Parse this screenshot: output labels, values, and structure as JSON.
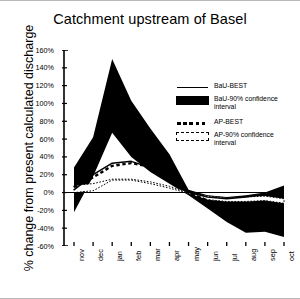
{
  "chart_data": {
    "type": "area",
    "title": "Catchment upstream of Basel",
    "xlabel": "",
    "ylabel": "% change from present calculated discharge",
    "categories": [
      "nov",
      "dec",
      "jan",
      "feb",
      "mar",
      "apr",
      "may",
      "jun",
      "jul",
      "aug",
      "sep",
      "oct"
    ],
    "ylim": [
      -60,
      160
    ],
    "ytick_labels": [
      "160%",
      "140%",
      "120%",
      "100%",
      "80%",
      "60%",
      "40%",
      "20%",
      "0%",
      "-20%",
      "-40%",
      "-60%"
    ],
    "ytick_values": [
      160,
      140,
      120,
      100,
      80,
      60,
      40,
      20,
      0,
      -20,
      -40,
      -60
    ],
    "grid": false,
    "legend_position": "upper right",
    "series": [
      {
        "name": "BaU-BEST",
        "style": "solid-line",
        "values": [
          3,
          20,
          33,
          35,
          28,
          14,
          0,
          -5,
          -7,
          -5,
          -2,
          1
        ]
      },
      {
        "name": "BaU-90% confidence interval",
        "style": "filled-band",
        "upper": [
          28,
          62,
          150,
          103,
          72,
          43,
          3,
          -3,
          -5,
          -3,
          0,
          8
        ],
        "lower": [
          -22,
          18,
          67,
          40,
          23,
          10,
          -3,
          -18,
          -33,
          -45,
          -44,
          -50
        ]
      },
      {
        "name": "AP-BEST",
        "style": "dotted-line",
        "values": [
          6,
          17,
          30,
          33,
          29,
          17,
          0,
          -9,
          -13,
          -14,
          -14,
          -14
        ]
      },
      {
        "name": "AP-90% confidence interval",
        "style": "dotted-band",
        "upper": [
          8,
          10,
          15,
          15,
          12,
          7,
          0,
          -4,
          -6,
          -5,
          -4,
          -7
        ],
        "lower": [
          0,
          2,
          14,
          14,
          10,
          5,
          -1,
          -8,
          -10,
          -10,
          -9,
          -12
        ]
      }
    ]
  },
  "legend": {
    "entries": [
      {
        "label": "BaU-BEST",
        "swatch": "solid-line-swatch"
      },
      {
        "label": "BaU-90% confidence interval",
        "swatch": "filled-rect-swatch"
      },
      {
        "label": "AP-BEST",
        "swatch": "dotted-line-swatch"
      },
      {
        "label": "AP-90% confidence interval",
        "swatch": "dashed-rect-swatch"
      }
    ]
  }
}
